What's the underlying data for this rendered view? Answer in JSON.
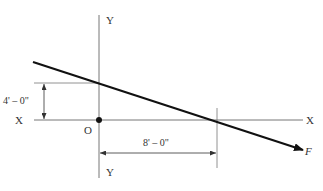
{
  "diagram": {
    "axes": {
      "x_label_left": "X",
      "x_label_right": "X",
      "y_label_top": "Y",
      "y_label_bottom": "Y",
      "origin_label": "O"
    },
    "force": {
      "label": "F",
      "direction": "down-right"
    },
    "dimensions": {
      "vertical_offset": "4' – 0\"",
      "horizontal_offset": "8' – 0\""
    },
    "colors": {
      "background": "#ffffff",
      "axis_line": "#777777",
      "force_line": "#111111",
      "text": "#333333"
    }
  }
}
